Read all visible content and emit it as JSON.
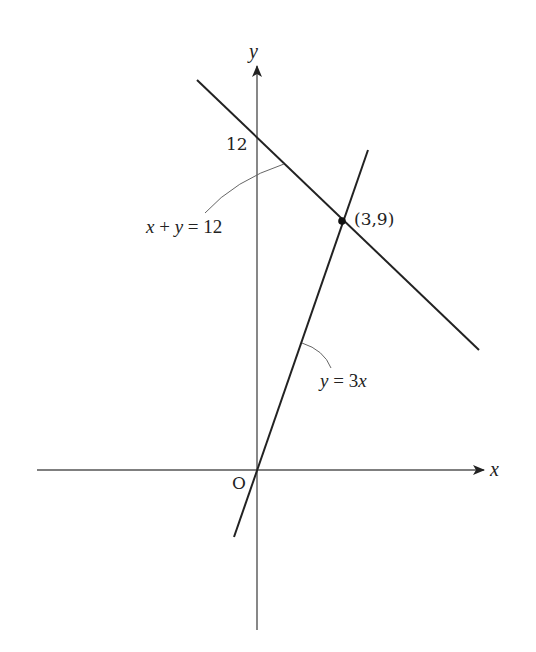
{
  "diagram": {
    "type": "coordinate-graph",
    "axes": {
      "x_label": "x",
      "y_label": "y",
      "origin_label": "O"
    },
    "ticks": {
      "y_intercept_label": "12"
    },
    "lines": [
      {
        "name": "x-plus-y-equals-12",
        "equation": "x + y = 12",
        "label_parts": [
          "x",
          " + ",
          "y",
          " = 12"
        ]
      },
      {
        "name": "y-equals-3x",
        "equation": "y = 3x",
        "label_parts": [
          "y",
          " = 3",
          "x"
        ]
      }
    ],
    "intersection": {
      "label": "(3,9)",
      "x": 3,
      "y": 9
    },
    "colors": {
      "line": "#222222",
      "axis": "#555555",
      "leader": "#666666",
      "background": "#ffffff"
    }
  }
}
